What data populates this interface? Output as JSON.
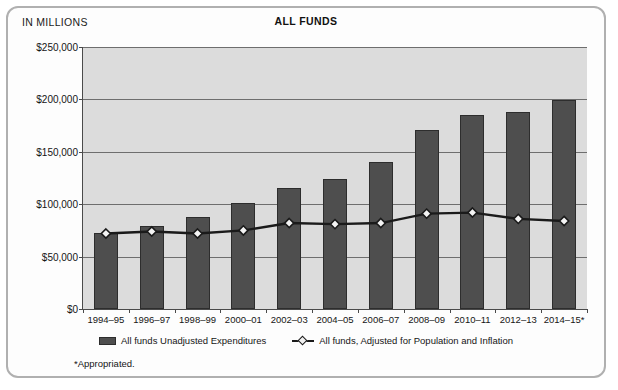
{
  "figure": {
    "units_label": "IN MILLIONS",
    "footnote": "*Appropriated."
  },
  "chart_data": {
    "type": "bar",
    "title": "ALL FUNDS",
    "xlabel": "",
    "ylabel": "IN MILLIONS",
    "ylim": [
      0,
      250000
    ],
    "yticks": [
      0,
      50000,
      100000,
      150000,
      200000,
      250000
    ],
    "ytick_labels": [
      "$0",
      "$50,000",
      "$100,000",
      "$150,000",
      "$200,000",
      "$250,000"
    ],
    "grid": true,
    "legend_position": "bottom",
    "categories": [
      "1994–95",
      "1996–97",
      "1998–99",
      "2000–01",
      "2002–03",
      "2004–05",
      "2006–07",
      "2008–09",
      "2010–11",
      "2012–13",
      "2014–15*"
    ],
    "series": [
      {
        "name": "All funds Unadjusted Expenditures",
        "type": "bar",
        "color": "#4e4e4e",
        "values": [
          73000,
          79000,
          88000,
          101000,
          115000,
          124000,
          140000,
          171000,
          185000,
          188000,
          199000
        ]
      },
      {
        "name": "All funds, Adjusted for Population and Inflation",
        "type": "line",
        "color": "#1a1a1a",
        "marker": "diamond",
        "values": [
          72000,
          74000,
          72000,
          75000,
          82000,
          81000,
          82000,
          91000,
          92000,
          86000,
          84000
        ]
      }
    ],
    "annotations": [
      "*Appropriated."
    ]
  },
  "legend": {
    "entries": [
      {
        "label": "All funds Unadjusted Expenditures",
        "marker": "bar-swatch"
      },
      {
        "label": "All funds, Adjusted for Population and Inflation",
        "marker": "line-diamond-swatch"
      }
    ]
  }
}
